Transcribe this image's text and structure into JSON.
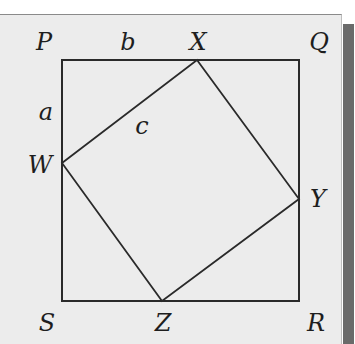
{
  "figure": {
    "colors": {
      "panel_background": "#ececec",
      "page_background": "#ffffff",
      "shadow": "#6a6a6a",
      "line": "#2a2a2a",
      "label": "#1e1e1e"
    },
    "outer_square": {
      "vertices": {
        "P": [
          62,
          60
        ],
        "Q": [
          299,
          60
        ],
        "R": [
          299,
          301
        ],
        "S": [
          62,
          301
        ]
      }
    },
    "inner_square": {
      "vertices": {
        "W": [
          62,
          163
        ],
        "X": [
          197,
          60
        ],
        "Y": [
          299,
          199
        ],
        "Z": [
          162,
          301
        ]
      }
    },
    "labels": {
      "P": "P",
      "Q": "Q",
      "R": "R",
      "S": "S",
      "W": "W",
      "X": "X",
      "Y": "Y",
      "Z": "Z",
      "a": "a",
      "b": "b",
      "c": "c"
    }
  }
}
